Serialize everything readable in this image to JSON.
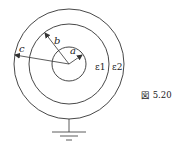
{
  "diagram": {
    "caption": "図 5.20",
    "labels": {
      "inner_radius": "a",
      "middle_radius": "b",
      "outer_radius": "c",
      "inner_region": "ε1",
      "outer_region": "ε2"
    },
    "circles": [
      {
        "name": "inner-conductor",
        "radius_label": "a"
      },
      {
        "name": "middle-boundary",
        "radius_label": "b"
      },
      {
        "name": "outer-conductor",
        "radius_label": "c"
      }
    ],
    "ground": "ground-symbol",
    "stroke_color": "#333333"
  }
}
